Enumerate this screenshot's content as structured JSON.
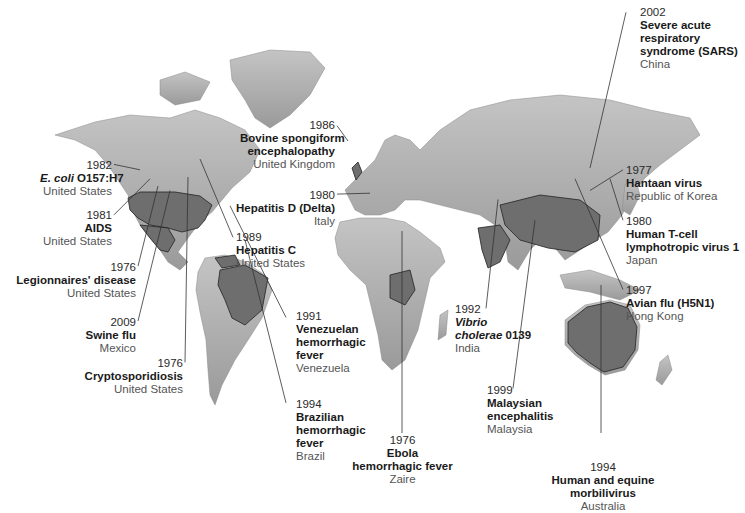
{
  "map": {
    "type": "world map",
    "description": "Emerging infectious diseases by year, disease name and country",
    "colors": {
      "land": "#a9a9a9",
      "highlight": "#6e6e6e",
      "border": "#222222",
      "ocean": "#ffffff"
    }
  },
  "labels": [
    {
      "id": "ecoli",
      "year": "1982",
      "name_italic": "E. coli",
      "name": " O157:H7",
      "country": "United States"
    },
    {
      "id": "aids",
      "year": "1981",
      "name": "AIDS",
      "country": "United States"
    },
    {
      "id": "legionnaires",
      "year": "1976",
      "name": "Legionnaires' disease",
      "country": "United States"
    },
    {
      "id": "swine",
      "year": "2009",
      "name": "Swine flu",
      "country": "Mexico"
    },
    {
      "id": "crypto",
      "year": "1976",
      "name": "Cryptosporidiosis",
      "country": "United States"
    },
    {
      "id": "bse",
      "year": "1986",
      "name1": "Bovine spongiform",
      "name2": "encephalopathy",
      "country": "United Kingdom"
    },
    {
      "id": "hepd",
      "year": "1980",
      "name": "Hepatitis D (Delta)",
      "country": "Italy"
    },
    {
      "id": "hepc",
      "year": "1989",
      "name": "Hepatitis C",
      "country": "United States"
    },
    {
      "id": "venez",
      "year": "1991",
      "name1": "Venezuelan",
      "name2": "hemorrhagic",
      "name3": "fever",
      "country": "Venezuela"
    },
    {
      "id": "brazil",
      "year": "1994",
      "name1": "Brazilian",
      "name2": "hemorrhagic",
      "name3": "fever",
      "country": "Brazil"
    },
    {
      "id": "ebola",
      "year": "1976",
      "name1": "Ebola",
      "name2": "hemorrhagic fever",
      "country": "Zaire"
    },
    {
      "id": "vibrio",
      "year": "1992",
      "name_italic1": "Vibrio",
      "name_italic2": "cholerae",
      "name_rest": " 0139",
      "country": "India"
    },
    {
      "id": "malaysian",
      "year": "1999",
      "name1": "Malaysian",
      "name2": "encephalitis",
      "country": "Malaysia"
    },
    {
      "id": "hendra",
      "year": "1994",
      "name1": "Human and equine",
      "name2": "morbilivirus",
      "country": "Australia"
    },
    {
      "id": "sars",
      "year": "2002",
      "name1": "Severe acute",
      "name2": "respiratory",
      "name3": "syndrome (SARS)",
      "country": "China"
    },
    {
      "id": "hantaan",
      "year": "1977",
      "name": "Hantaan virus",
      "country": "Republic of Korea"
    },
    {
      "id": "htlv",
      "year": "1980",
      "name1": "Human T-cell",
      "name2": "lymphotropic virus 1",
      "country": "Japan"
    },
    {
      "id": "avian",
      "year": "1997",
      "name": "Avian flu (H5N1)",
      "country": "Hong Kong"
    }
  ]
}
